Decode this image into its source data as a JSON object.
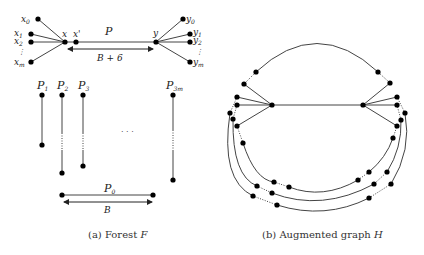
{
  "figure_a": {
    "caption": "(a) Forest F",
    "caption_prefix": "(a) Forest ",
    "caption_var": "F",
    "path_label": "P",
    "path_length_label": "B + 6",
    "x_labels": [
      "x0",
      "x1",
      "x2",
      "⋮",
      "xm"
    ],
    "y_labels": [
      "y0",
      "y1",
      "y2",
      "⋮",
      "ym"
    ],
    "center_labels": [
      "x",
      "x'",
      "y"
    ],
    "paths": [
      "P1",
      "P2",
      "P3",
      "P3m"
    ],
    "ellipsis": "· · ·",
    "base_path_label": "P0",
    "base_length_label": "B"
  },
  "figure_b": {
    "caption_prefix": "(b) Augmented graph ",
    "caption_var": "H"
  },
  "colors": {
    "line": "#444444",
    "node": "#000000",
    "text": "#222222"
  }
}
